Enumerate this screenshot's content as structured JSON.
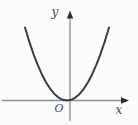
{
  "figure": {
    "background": "#fcfcfc",
    "axis_color": "#8f8f8f",
    "arrow_color": "#2e2e2e",
    "curve_color": "#3d3d3d",
    "label_color": "#4a4a4a",
    "labels": {
      "y_axis": "y",
      "x_axis": "x",
      "origin": "O"
    }
  },
  "chart_data": {
    "type": "line",
    "equation": "y = x^2",
    "xlabel": "x",
    "ylabel": "y",
    "origin_label": "O",
    "x_range": [
      -1,
      1
    ],
    "y_range": [
      0,
      1
    ],
    "grid": false,
    "legend": false,
    "series": [
      {
        "name": "parabola",
        "points": [
          [
            -1.0,
            1.0
          ],
          [
            -0.9,
            0.81
          ],
          [
            -0.8,
            0.64
          ],
          [
            -0.7,
            0.49
          ],
          [
            -0.6,
            0.36
          ],
          [
            -0.5,
            0.25
          ],
          [
            -0.4,
            0.16
          ],
          [
            -0.3,
            0.09
          ],
          [
            -0.2,
            0.04
          ],
          [
            -0.1,
            0.01
          ],
          [
            0.0,
            0.0
          ],
          [
            0.1,
            0.01
          ],
          [
            0.2,
            0.04
          ],
          [
            0.3,
            0.09
          ],
          [
            0.4,
            0.16
          ],
          [
            0.5,
            0.25
          ],
          [
            0.6,
            0.36
          ],
          [
            0.7,
            0.49
          ],
          [
            0.8,
            0.64
          ],
          [
            0.9,
            0.81
          ],
          [
            1.0,
            1.0
          ]
        ]
      }
    ]
  }
}
